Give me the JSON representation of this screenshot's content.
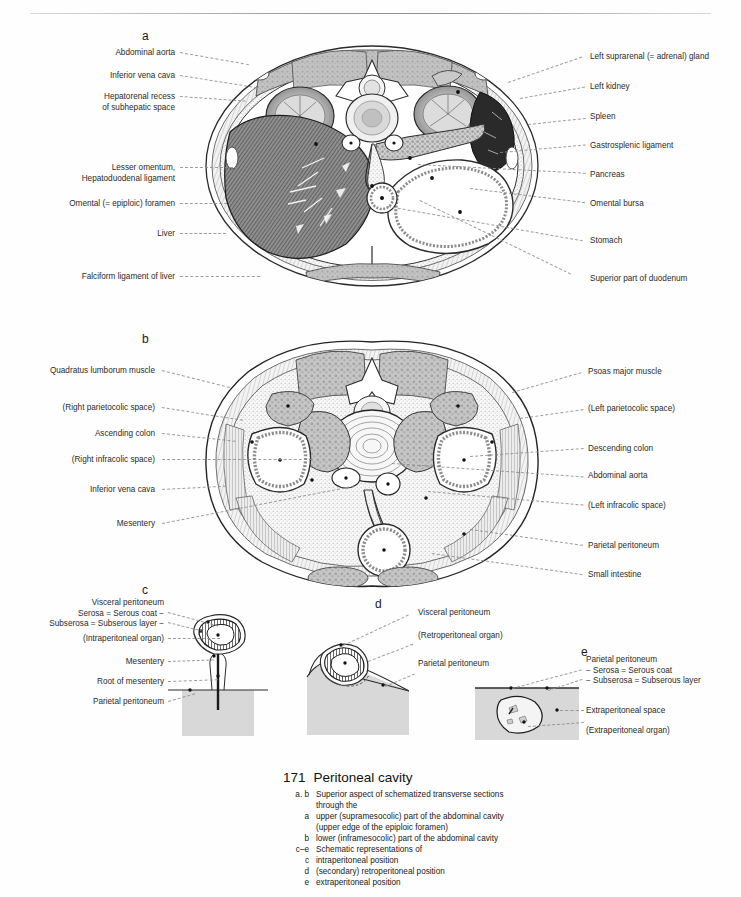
{
  "page": {
    "running_header": "",
    "background": "#fefefe"
  },
  "panels": {
    "a": {
      "letter": "a",
      "labels_left": [
        "Abdominal aorta",
        "Inferior vena cava",
        "Hepatorenal recess\nof subhepatic space",
        "Lesser omentum,\nHepatoduodenal ligament",
        "Omental (= epiploic) foramen",
        "Liver",
        "Falciform ligament of liver"
      ],
      "labels_right": [
        "Left suprarenal (= adrenal) gland",
        "Left kidney",
        "Spleen",
        "Gastrosplenic ligament",
        "Pancreas",
        "Omental bursa",
        "Stomach",
        "Superior part of duodenum"
      ]
    },
    "b": {
      "letter": "b",
      "labels_left": [
        "Quadratus lumborum muscle",
        "(Right parietocolic space)",
        "Ascending colon",
        "(Right infracolic space)",
        "Inferior vena cava",
        "Mesentery"
      ],
      "labels_right": [
        "Psoas major muscle",
        "(Left parietocolic space)",
        "Descending colon",
        "Abdominal aorta",
        "(Left infracolic space)",
        "Parietal peritoneum",
        "Small intestine"
      ]
    },
    "c": {
      "letter": "c",
      "labels_left": [
        "Visceral peritoneum\nSerosa = Serous coat −\nSubserosa = Subserous layer −",
        "(Intraperitoneal organ)",
        "Mesentery",
        "Root of mesentery",
        "Parietal peritoneum"
      ]
    },
    "d": {
      "letter": "d",
      "labels_right": [
        "Visceral peritoneum",
        "(Retroperitoneal organ)",
        "Parietal peritoneum"
      ]
    },
    "e": {
      "letter": "e",
      "labels_right": [
        "Parietal peritoneum\n− Serosa = Serous coat\n− Subserosa = Subserous layer",
        "Extraperitoneal space",
        "(Extraperitoneal organ)"
      ]
    }
  },
  "caption": {
    "number": "171",
    "title": "Peritoneal cavity",
    "rows": [
      {
        "key": "a. b",
        "value": "Superior aspect of schematized transverse sections"
      },
      {
        "key": "",
        "value": "through the",
        "continuation": true
      },
      {
        "key": "a",
        "value": "upper (supramesocolic) part of the abdominal cavity"
      },
      {
        "key": "",
        "value": "(upper edge of the epiploic foramen)",
        "continuation": true
      },
      {
        "key": "b",
        "value": "lower (inframesocolic) part of the abdominal cavity"
      },
      {
        "key": "c–e",
        "value": "Schematic representations of"
      },
      {
        "key": "c",
        "value": "intraperitoneal position"
      },
      {
        "key": "d",
        "value": "(secondary) retroperitoneal position"
      },
      {
        "key": "e",
        "value": "extraperitoneal position"
      }
    ]
  },
  "colors": {
    "ink": "#1a1a1a",
    "leader": "#8d8d8d",
    "gray_fill": "#d6d6d6",
    "mid_gray": "#9c9c9c",
    "dark_fill": "#4a4a4a"
  }
}
